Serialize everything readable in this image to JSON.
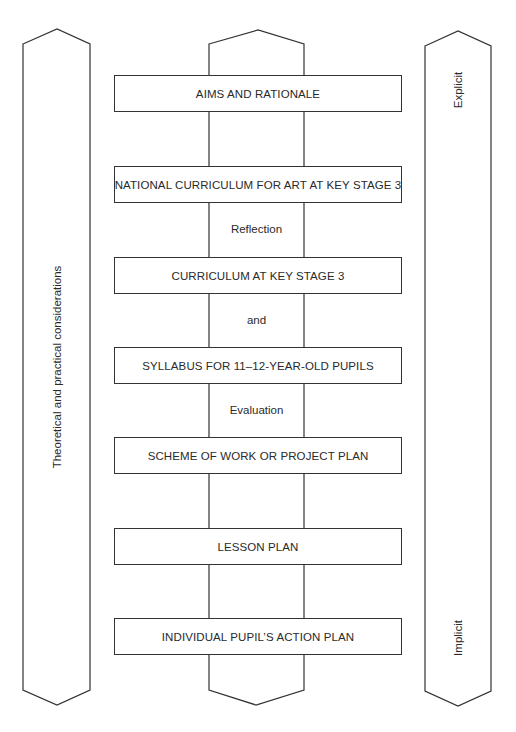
{
  "diagram": {
    "columns": {
      "left": {
        "label": "Theoretical and practical considerations"
      },
      "center": {
        "label": ""
      },
      "right": {
        "top_label": "Explicit",
        "bottom_label": "Implicit"
      }
    },
    "boxes": [
      {
        "label": "AIMS AND RATIONALE",
        "top": 75
      },
      {
        "label": "NATIONAL CURRICULUM FOR ART AT KEY STAGE 3",
        "top": 166
      },
      {
        "label": "CURRICULUM AT KEY STAGE 3",
        "top": 257
      },
      {
        "label": "SYLLABUS FOR 11–12-YEAR-OLD PUPILS",
        "top": 347
      },
      {
        "label": "SCHEME OF WORK OR PROJECT PLAN",
        "top": 437
      },
      {
        "label": "LESSON PLAN",
        "top": 528
      },
      {
        "label": "INDIVIDUAL PUPIL’S ACTION PLAN",
        "top": 618
      }
    ],
    "connectors": [
      {
        "label": "Reflection",
        "top": 223
      },
      {
        "label": "and",
        "top": 314
      },
      {
        "label": "Evaluation",
        "top": 404
      }
    ],
    "colors": {
      "stroke": "#333333",
      "text": "#2a2a2a",
      "background": "#ffffff"
    }
  }
}
